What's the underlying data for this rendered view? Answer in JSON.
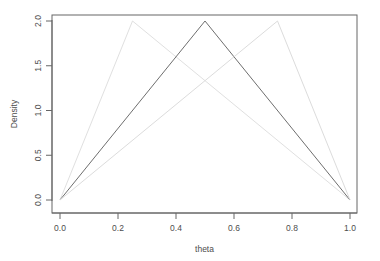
{
  "chart_data": {
    "type": "line",
    "title": "",
    "subtitle": "",
    "xlabel": "theta",
    "ylabel": "Density",
    "xlim": [
      0.0,
      1.0
    ],
    "ylim": [
      0.0,
      2.05
    ],
    "xticks": [
      "0.0",
      "0.2",
      "0.4",
      "0.6",
      "0.8",
      "1.0"
    ],
    "xtick_values": [
      0.0,
      0.2,
      0.4,
      0.6,
      0.8,
      1.0
    ],
    "yticks": [
      "0.0",
      "0.5",
      "1.0",
      "1.5",
      "2.0"
    ],
    "ytick_values": [
      0.0,
      0.5,
      1.0,
      1.5,
      2.0
    ],
    "grid": "off",
    "legend": "none",
    "background": "#ffffff",
    "box_color": "#666666",
    "axis_color": "#666666",
    "series": [
      {
        "name": "peak-0.25",
        "color": "#e0e0e0",
        "linewidth": 1,
        "x": [
          0.0,
          0.25,
          1.0
        ],
        "values": [
          0.0,
          2.0,
          0.0
        ]
      },
      {
        "name": "peak-0.50",
        "color": "#6e6e6e",
        "linewidth": 1,
        "x": [
          0.0,
          0.5,
          1.0
        ],
        "values": [
          0.0,
          2.0,
          0.0
        ]
      },
      {
        "name": "peak-0.75",
        "color": "#dcdcdc",
        "linewidth": 1,
        "x": [
          0.0,
          0.75,
          1.0
        ],
        "values": [
          0.0,
          2.0,
          0.0
        ]
      }
    ]
  },
  "axes": {
    "x_title": "theta",
    "y_title": "Density",
    "x_tick_labels": [
      "0.0",
      "0.2",
      "0.4",
      "0.6",
      "0.8",
      "1.0"
    ],
    "y_tick_labels": [
      "0.0",
      "0.5",
      "1.0",
      "1.5",
      "2.0"
    ]
  }
}
